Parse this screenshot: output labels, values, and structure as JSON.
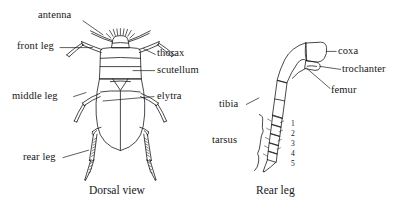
{
  "figure": {
    "kind": "entomological-line-diagram",
    "ink_color": "#1a1a1a",
    "background_color": "#ffffff"
  },
  "panels": [
    {
      "id": "dorsal",
      "caption": "Dorsal view"
    },
    {
      "id": "rear-leg",
      "caption": "Rear leg"
    }
  ],
  "dorsal_labels": {
    "antenna": "antenna",
    "front_leg": "front leg",
    "middle_leg": "middle leg",
    "rear_leg": "rear leg",
    "thorax": "thorax",
    "scutellum": "scutellum",
    "elytra": "elytra"
  },
  "leg_labels": {
    "coxa": "coxa",
    "trochanter": "trochanter",
    "femur": "femur",
    "tibia": "tibia",
    "tarsus": "tarsus"
  },
  "tarsus_segments": [
    "1",
    "2",
    "3",
    "4",
    "5"
  ],
  "captions": {
    "dorsal": "Dorsal view",
    "rear_leg": "Rear leg"
  }
}
